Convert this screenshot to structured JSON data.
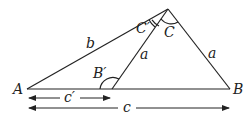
{
  "diagram": {
    "type": "triangle-ambiguous-case",
    "vertices": {
      "A": {
        "label": "A",
        "x": 27,
        "y": 89
      },
      "B": {
        "label": "B",
        "x": 230,
        "y": 89
      },
      "C": {
        "label": "",
        "x": 168,
        "y": 9
      },
      "B_prime": {
        "label": "",
        "x": 112,
        "y": 89
      }
    },
    "side_labels": {
      "b": "b",
      "a_inner": "a",
      "a_outer": "a",
      "c_prime": "c′",
      "c": "c"
    },
    "angle_labels": {
      "C_prime": "C′",
      "C": "C",
      "B_prime": "B′"
    },
    "colors": {
      "stroke": "#222222",
      "background": "#ffffff"
    }
  }
}
